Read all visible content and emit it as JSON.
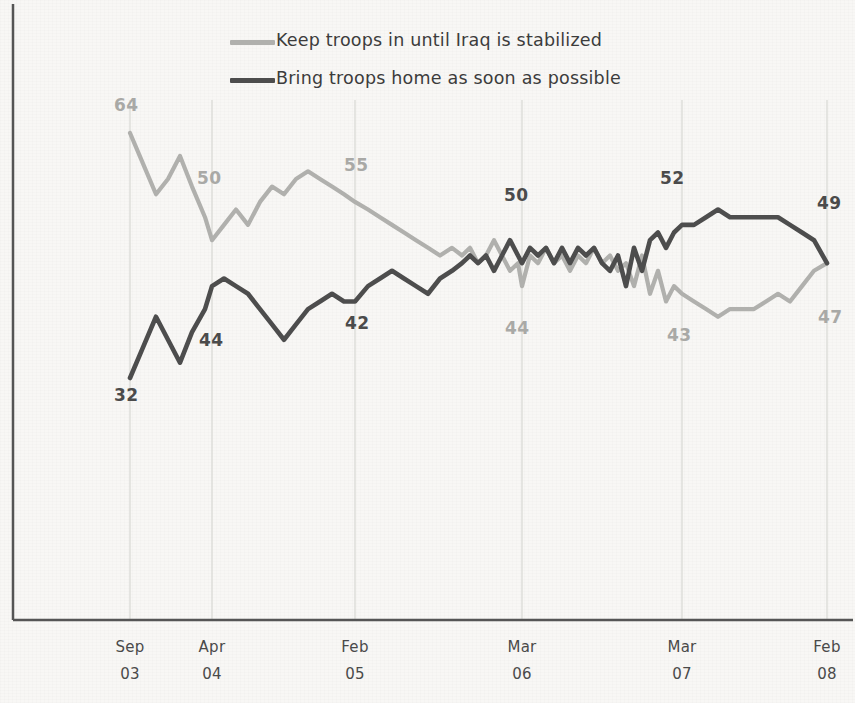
{
  "legend": {
    "position": "top-center",
    "entries": [
      {
        "label": "Keep troops in until Iraq is stabilized",
        "color": "#b0b0ad",
        "name": "keep-troops"
      },
      {
        "label": "Bring troops home as soon as possible",
        "color": "#4d4d4d",
        "name": "bring-troops"
      }
    ]
  },
  "axis": {
    "ticks": [
      {
        "month": "Sep",
        "year": "03"
      },
      {
        "month": "Apr",
        "year": "04"
      },
      {
        "month": "Feb",
        "year": "05"
      },
      {
        "month": "Mar",
        "year": "06"
      },
      {
        "month": "Mar",
        "year": "07"
      },
      {
        "month": "Feb",
        "year": "08"
      }
    ]
  },
  "annotations": [
    {
      "value": "64",
      "series": "keep-troops",
      "at": "Sep 03",
      "color": "light"
    },
    {
      "value": "32",
      "series": "bring-troops",
      "at": "Sep 03",
      "color": "dark"
    },
    {
      "value": "50",
      "series": "keep-troops",
      "at": "Apr 04",
      "color": "light"
    },
    {
      "value": "44",
      "series": "bring-troops",
      "at": "Apr 04",
      "color": "dark"
    },
    {
      "value": "55",
      "series": "keep-troops",
      "at": "Feb 05",
      "color": "light"
    },
    {
      "value": "42",
      "series": "bring-troops",
      "at": "Feb 05",
      "color": "dark"
    },
    {
      "value": "50",
      "series": "bring-troops",
      "at": "Mar 06",
      "color": "dark"
    },
    {
      "value": "44",
      "series": "keep-troops",
      "at": "Mar 06",
      "color": "light"
    },
    {
      "value": "52",
      "series": "bring-troops",
      "at": "Mar 07",
      "color": "dark"
    },
    {
      "value": "43",
      "series": "keep-troops",
      "at": "Mar 07",
      "color": "light"
    },
    {
      "value": "49",
      "series": "bring-troops",
      "at": "Feb 08",
      "color": "dark"
    },
    {
      "value": "47",
      "series": "keep-troops",
      "at": "Feb 08",
      "color": "light"
    }
  ],
  "chart_data": {
    "type": "line",
    "title": "",
    "xlabel": "",
    "ylabel": "",
    "ylim": [
      20,
      70
    ],
    "grid": "vertical-only",
    "legend_position": "top-center",
    "x_tick_labels": [
      "Sep 03",
      "Apr 04",
      "Feb 05",
      "Mar 06",
      "Mar 07",
      "Feb 08"
    ],
    "x_tick_positions": [
      130,
      212,
      355,
      522,
      682,
      827
    ],
    "series": [
      {
        "name": "Keep troops in until Iraq is stabilized",
        "color": "#b0b0ad",
        "labelled_points": {
          "Sep 03": 64,
          "Apr 04": 50,
          "Feb 05": 55,
          "Mar 06": 44,
          "Mar 07": 43,
          "Feb 08": 47
        },
        "x": [
          130,
          143,
          156,
          168,
          180,
          192,
          205,
          212,
          224,
          236,
          248,
          260,
          272,
          284,
          296,
          308,
          320,
          332,
          344,
          355,
          368,
          380,
          392,
          404,
          416,
          428,
          440,
          452,
          462,
          470,
          478,
          486,
          494,
          502,
          510,
          518,
          522,
          530,
          538,
          546,
          554,
          562,
          570,
          578,
          586,
          594,
          602,
          610,
          618,
          626,
          634,
          642,
          650,
          658,
          666,
          674,
          682,
          694,
          706,
          718,
          730,
          742,
          754,
          766,
          778,
          790,
          802,
          814,
          827
        ],
        "y": [
          64,
          60,
          56,
          58,
          61,
          57,
          53,
          50,
          52,
          54,
          52,
          55,
          57,
          56,
          58,
          59,
          58,
          57,
          56,
          55,
          54,
          53,
          52,
          51,
          50,
          49,
          48,
          49,
          48,
          49,
          47,
          48,
          50,
          48,
          46,
          47,
          44,
          48,
          47,
          49,
          47,
          48,
          46,
          48,
          47,
          49,
          47,
          48,
          46,
          47,
          44,
          48,
          43,
          46,
          42,
          44,
          43,
          42,
          41,
          40,
          41,
          41,
          41,
          42,
          43,
          42,
          44,
          46,
          47
        ]
      },
      {
        "name": "Bring troops home as soon as possible",
        "color": "#4d4d4d",
        "labelled_points": {
          "Sep 03": 32,
          "Apr 04": 44,
          "Feb 05": 42,
          "Mar 06": 50,
          "Mar 07": 52,
          "Feb 08": 49
        },
        "x": [
          130,
          143,
          156,
          168,
          180,
          192,
          205,
          212,
          224,
          236,
          248,
          260,
          272,
          284,
          296,
          308,
          320,
          332,
          344,
          355,
          368,
          380,
          392,
          404,
          416,
          428,
          440,
          452,
          462,
          470,
          478,
          486,
          494,
          502,
          510,
          518,
          522,
          530,
          538,
          546,
          554,
          562,
          570,
          578,
          586,
          594,
          602,
          610,
          618,
          626,
          634,
          642,
          650,
          658,
          666,
          674,
          682,
          694,
          706,
          718,
          730,
          742,
          754,
          766,
          778,
          790,
          802,
          814,
          827
        ],
        "y": [
          32,
          36,
          40,
          37,
          34,
          38,
          41,
          44,
          45,
          44,
          43,
          41,
          39,
          37,
          39,
          41,
          42,
          43,
          42,
          42,
          44,
          45,
          46,
          45,
          44,
          43,
          45,
          46,
          47,
          48,
          47,
          48,
          46,
          48,
          50,
          48,
          47,
          49,
          48,
          49,
          47,
          49,
          47,
          49,
          48,
          49,
          47,
          46,
          48,
          44,
          49,
          46,
          50,
          51,
          49,
          51,
          52,
          52,
          53,
          54,
          53,
          53,
          53,
          53,
          53,
          52,
          51,
          50,
          47
        ]
      }
    ]
  }
}
